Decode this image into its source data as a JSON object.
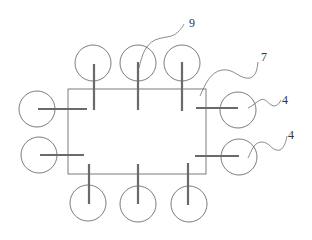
{
  "diagram": {
    "labels": [
      {
        "id": "label-9",
        "text": "9",
        "x": 189,
        "y": 27
      },
      {
        "id": "label-7",
        "text": "7",
        "x": 261,
        "y": 61
      },
      {
        "id": "label-4a",
        "text": "4",
        "x": 282,
        "y": 104
      },
      {
        "id": "label-4b",
        "text": "4",
        "x": 288,
        "y": 139
      }
    ],
    "frame": {
      "x": 68,
      "y": 89,
      "width": 138,
      "height": 85
    },
    "circle_radius": 18,
    "colors": {
      "line": "#5a5a5a",
      "rod": "#6a6a6a",
      "background": "#ffffff"
    }
  }
}
